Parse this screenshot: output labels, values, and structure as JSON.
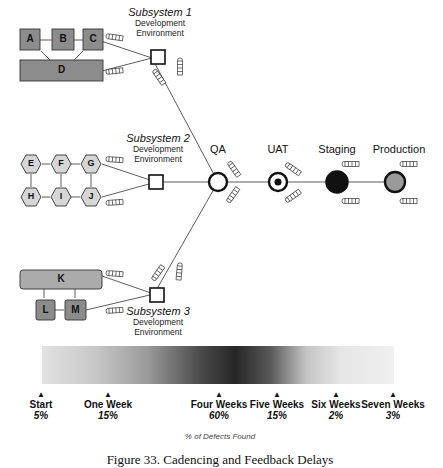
{
  "diagram": {
    "subsystems": [
      {
        "title": "Subsystem 1",
        "env_line1": "Development",
        "env_line2": "Environment",
        "components": [
          "A",
          "B",
          "C",
          "D"
        ]
      },
      {
        "title": "Subsystem 2",
        "env_line1": "Development",
        "env_line2": "Environment",
        "components": [
          "E",
          "F",
          "G",
          "H",
          "I",
          "J"
        ]
      },
      {
        "title": "Subsystem 3",
        "env_line1": "Development",
        "env_line2": "Environment",
        "components": [
          "K",
          "L",
          "M"
        ]
      }
    ],
    "stages": [
      {
        "label": "QA",
        "marker": "hollow-circle"
      },
      {
        "label": "UAT",
        "marker": "bullseye"
      },
      {
        "label": "Staging",
        "marker": "filled-black-circle"
      },
      {
        "label": "Production",
        "marker": "filled-gray-circle"
      }
    ],
    "queue_icon": "batch-queue-icon",
    "colors": {
      "box_fill": "#8c8c8c",
      "light_box_fill": "#ababab",
      "hex_fill": "#d6d6d6",
      "line": "#333333",
      "staging_fill": "#111111",
      "production_fill": "#9a9a9a"
    }
  },
  "timeline": {
    "ticks": [
      {
        "name": "Start",
        "pct": "5%"
      },
      {
        "name": "One Week",
        "pct": "15%"
      },
      {
        "name": "Four Weeks",
        "pct": "60%"
      },
      {
        "name": "Five Weeks",
        "pct": "15%"
      },
      {
        "name": "Six Weeks",
        "pct": "2%"
      },
      {
        "name": "Seven Weeks",
        "pct": "3%"
      }
    ],
    "axis_title": "% of Defects Found"
  },
  "caption": "Figure 33. Cadencing and Feedback Delays"
}
